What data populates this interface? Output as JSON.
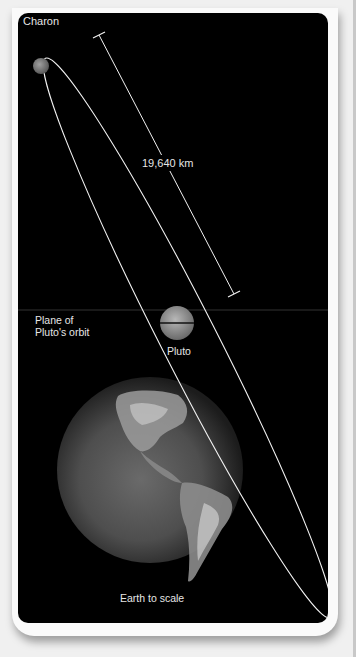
{
  "diagram": {
    "labels": {
      "charon": "Charon",
      "distance": "19,640 km",
      "plane_line1": "Plane of",
      "plane_line2": "Pluto's orbit",
      "pluto": "Pluto",
      "earth": "Earth to scale"
    },
    "colors": {
      "background": "#000000",
      "orbit": "#f2f2f2",
      "text": "#e6e6e6",
      "charon": "#8a8a8a",
      "pluto": "#9a9a9a"
    },
    "objects": [
      "Charon",
      "Pluto",
      "Earth"
    ],
    "measurement": {
      "value": "19,640 km",
      "description": "Distance between Pluto and Charon"
    }
  }
}
